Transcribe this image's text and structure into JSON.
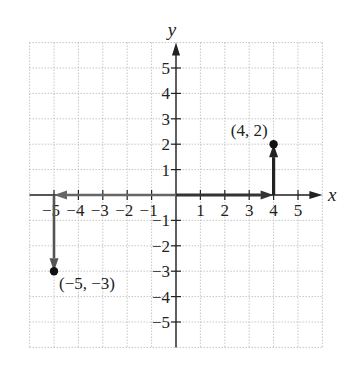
{
  "chart_data": {
    "type": "scatter",
    "title": "",
    "xlabel": "x",
    "ylabel": "y",
    "xlim": [
      -6,
      6
    ],
    "ylim": [
      -6,
      6
    ],
    "grid": true,
    "x_ticks": [
      -5,
      -4,
      -3,
      -2,
      -1,
      1,
      2,
      3,
      4,
      5
    ],
    "y_ticks": [
      5,
      4,
      3,
      2,
      1,
      -1,
      -2,
      -3,
      -4,
      -5
    ],
    "x_tick_labels": [
      "−5",
      "−4",
      "−3",
      "−2",
      "−1",
      "1",
      "2",
      "3",
      "4",
      "5"
    ],
    "y_tick_labels": [
      "5",
      "4",
      "3",
      "2",
      "1",
      "−1",
      "−2",
      "−3",
      "−4",
      "−5"
    ],
    "points": [
      {
        "x": 4,
        "y": 2,
        "label": "(4, 2)"
      },
      {
        "x": -5,
        "y": -3,
        "label": "(−5, −3)"
      }
    ],
    "arrows": [
      {
        "from": [
          0,
          0
        ],
        "to": [
          4,
          0
        ],
        "color": "#333333",
        "style": "dark"
      },
      {
        "from": [
          4,
          0
        ],
        "to": [
          4,
          2
        ],
        "color": "#222222",
        "style": "dark"
      },
      {
        "from": [
          0,
          0
        ],
        "to": [
          -5,
          0
        ],
        "color": "#666666",
        "style": "gray"
      },
      {
        "from": [
          -5,
          0
        ],
        "to": [
          -5,
          -3
        ],
        "color": "#555555",
        "style": "gray"
      }
    ]
  },
  "labels": {
    "x_axis": "x",
    "y_axis": "y",
    "point_a": "(4, 2)",
    "point_b": "(−5, −3)"
  }
}
